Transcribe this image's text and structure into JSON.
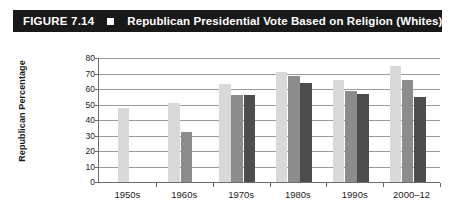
{
  "header": {
    "figure_number": "FIGURE 7.14",
    "bullet_icon": "square-bullet-icon",
    "title": "Republican Presidential Vote Based on Religion (Whites)",
    "background_color": "#191919",
    "text_color": "#ffffff"
  },
  "chart_data": {
    "type": "bar",
    "title": "Republican Presidential Vote Based on Religion (Whites)",
    "xlabel": "",
    "ylabel": "Republican Percentage",
    "ylim": [
      0,
      80
    ],
    "ytick_step": 10,
    "yticks": [
      0,
      10,
      20,
      30,
      40,
      50,
      60,
      70,
      80
    ],
    "ytick_labels": [
      "0",
      "10",
      "20",
      "30",
      "40",
      "50",
      "60",
      "70",
      "80"
    ],
    "grid": true,
    "grid_axis": "y",
    "legend": false,
    "categories": [
      "1950s",
      "1960s",
      "1970s",
      "1980s",
      "1990s",
      "2000–12"
    ],
    "series": [
      {
        "name": "series-1",
        "color": "#d9d9d9",
        "values": [
          48,
          51,
          63,
          71,
          66,
          75
        ]
      },
      {
        "name": "series-2",
        "color": "#8c8c8c",
        "values": [
          null,
          32.5,
          56,
          68.5,
          58.5,
          66
        ]
      },
      {
        "name": "series-3",
        "color": "#4d4d4d",
        "values": [
          null,
          null,
          56,
          64,
          57,
          55
        ]
      }
    ]
  },
  "colors": {
    "grid": "#9a9a9a",
    "axis": "#6a6a6a",
    "text": "#1a1a1a",
    "background": "#ffffff"
  }
}
